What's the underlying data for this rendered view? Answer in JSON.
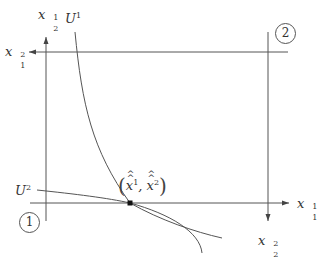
{
  "diagram": {
    "type": "edgeworth-box",
    "stroke_color": "#555555",
    "text_color": "#333333",
    "axes": {
      "agent1_horizontal": {
        "label_base": "x",
        "label_sub": "1",
        "label_sup": "1"
      },
      "agent1_vertical": {
        "label_base": "x",
        "label_sub": "2",
        "label_sup": "1"
      },
      "agent2_horizontal": {
        "label_base": "x",
        "label_sub": "1",
        "label_sup": "2"
      },
      "agent2_vertical": {
        "label_base": "x",
        "label_sub": "2",
        "label_sup": "2"
      }
    },
    "curves": {
      "u1": {
        "label_base": "U",
        "label_sup": "1"
      },
      "u2": {
        "label_base": "U",
        "label_sup": "2"
      }
    },
    "point": {
      "open": "(",
      "x1_base": "x",
      "x1_sup": "1",
      "sep": ",",
      "x2_base": "x",
      "x2_sup": "2",
      "close": ")"
    },
    "origins": {
      "agent1": "1",
      "agent2": "2"
    }
  }
}
